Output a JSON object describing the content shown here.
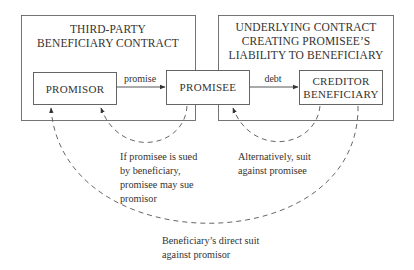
{
  "diagram": {
    "groups": [
      {
        "id": "third_party_contract",
        "lines": [
          "THIRD-PARTY",
          "BENEFICIARY CONTRACT"
        ]
      },
      {
        "id": "underlying_contract",
        "lines": [
          "UNDERLYING CONTRACT",
          "CREATING PROMISEE’S",
          "LIABILITY TO BENEFICIARY"
        ]
      }
    ],
    "nodes": [
      {
        "id": "promisor",
        "lines": [
          "PROMISOR"
        ]
      },
      {
        "id": "promisee",
        "lines": [
          "PROMISEE"
        ]
      },
      {
        "id": "creditor_beneficiary",
        "lines": [
          "CREDITOR",
          "BENEFICIARY"
        ]
      }
    ],
    "edges": [
      {
        "from": "promisor",
        "to": "promisee",
        "label": "promise",
        "style": "solid"
      },
      {
        "from": "promisee",
        "to": "creditor_beneficiary",
        "label": "debt",
        "style": "solid"
      },
      {
        "from": "promisee",
        "to": "promisor",
        "style": "dashed",
        "label_lines": [
          "If promisee is sued",
          "by beneficiary,",
          "promisee may sue",
          "promisor"
        ]
      },
      {
        "from": "creditor_beneficiary",
        "to": "promisee",
        "style": "dashed",
        "label_lines": [
          "Alternatively, suit",
          "against promisee"
        ]
      },
      {
        "from": "creditor_beneficiary",
        "to": "promisor",
        "style": "dashed",
        "label_lines": [
          "Beneficiary’s direct suit",
          "against promisor"
        ]
      }
    ]
  }
}
